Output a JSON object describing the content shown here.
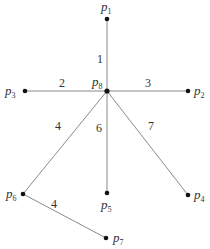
{
  "diagram": {
    "type": "weighted-tree",
    "colors": {
      "edge": "#8a8a8a",
      "node": "#111111",
      "text": "#333333",
      "background": "#ffffff"
    },
    "nodes": [
      {
        "id": "p1",
        "label": "p",
        "sub": "1",
        "x": 107,
        "y": 19
      },
      {
        "id": "p2",
        "label": "p",
        "sub": "2",
        "x": 188,
        "y": 91
      },
      {
        "id": "p3",
        "label": "p",
        "sub": "3",
        "x": 25,
        "y": 91
      },
      {
        "id": "p4",
        "label": "p",
        "sub": "4",
        "x": 188,
        "y": 195
      },
      {
        "id": "p5",
        "label": "p",
        "sub": "5",
        "x": 107,
        "y": 193
      },
      {
        "id": "p6",
        "label": "p",
        "sub": "6",
        "x": 23,
        "y": 194
      },
      {
        "id": "p7",
        "label": "p",
        "sub": "7",
        "x": 106,
        "y": 238
      },
      {
        "id": "p8",
        "label": "p",
        "sub": "8",
        "x": 107,
        "y": 91
      }
    ],
    "edges": [
      {
        "from": "p8",
        "to": "p1",
        "weight": "1"
      },
      {
        "from": "p8",
        "to": "p3",
        "weight": "2"
      },
      {
        "from": "p8",
        "to": "p2",
        "weight": "3"
      },
      {
        "from": "p8",
        "to": "p6",
        "weight": "4"
      },
      {
        "from": "p8",
        "to": "p5",
        "weight": "6"
      },
      {
        "from": "p8",
        "to": "p4",
        "weight": "7"
      },
      {
        "from": "p6",
        "to": "p7",
        "weight": "4"
      }
    ]
  }
}
